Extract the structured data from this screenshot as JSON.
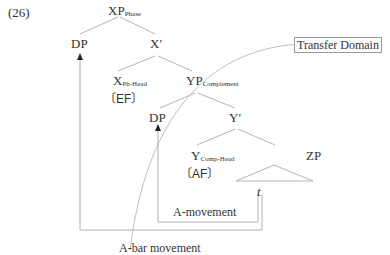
{
  "example_number": "(26)",
  "nodes": {
    "xp": {
      "label": "XP",
      "sub": "Phase"
    },
    "dp_spec": {
      "label": "DP"
    },
    "x_bar": {
      "label": "X′"
    },
    "x_head": {
      "label": "X",
      "sub": "Ph-Head",
      "feature": "〔EF〕"
    },
    "yp": {
      "label": "YP",
      "sub": "Complement"
    },
    "dp_inner": {
      "label": "DP"
    },
    "y_bar": {
      "label": "Y′"
    },
    "y_head": {
      "label": "Y",
      "sub": "Comp-Head",
      "feature": "〔AF〕"
    },
    "zp": {
      "label": "ZP"
    },
    "trace": {
      "label": "t"
    }
  },
  "annotations": {
    "transfer_domain": "Transfer Domain",
    "a_movement": "A-movement",
    "a_bar_movement": "A-bar movement"
  },
  "colors": {
    "line": "#aaaaaa",
    "text": "#333333"
  }
}
